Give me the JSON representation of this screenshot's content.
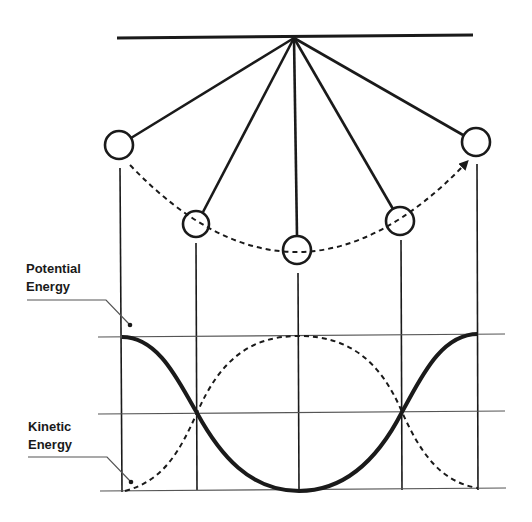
{
  "figure": {
    "labels": {
      "potential_energy_line1": "Potential",
      "potential_energy_line2": "Energy",
      "kinetic_energy_line1": "Kinetic",
      "kinetic_energy_line2": "Energy"
    },
    "colors": {
      "ink": "#1a1a1a",
      "thin": "#444444",
      "background": "#ffffff"
    },
    "pendulum": {
      "pivot": [
        294,
        38
      ],
      "support_bar": [
        [
          117,
          38
        ],
        [
          473,
          35
        ]
      ],
      "bobs": [
        {
          "cx": 119,
          "cy": 145,
          "r": 14
        },
        {
          "cx": 196,
          "cy": 224,
          "r": 13
        },
        {
          "cx": 297,
          "cy": 250,
          "r": 14
        },
        {
          "cx": 400,
          "cy": 221,
          "r": 14
        },
        {
          "cx": 476,
          "cy": 142,
          "r": 14
        }
      ],
      "swing_path": "dashed arc with arrow toward right bob"
    },
    "energy_plot": {
      "horizontal_lines_y": [
        337,
        413,
        490
      ],
      "vertical_lines_x": [
        121,
        196,
        299,
        402,
        477
      ],
      "potential_curve": "solid thick, max at ends, min at center",
      "kinetic_curve": "dashed, min at ends, max at center"
    }
  }
}
